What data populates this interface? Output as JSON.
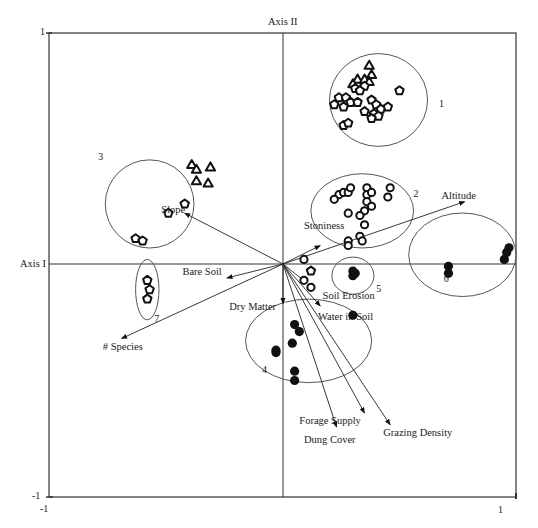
{
  "chart_data": {
    "type": "scatter",
    "subtype": "ordination-biplot",
    "title": "",
    "xlabel": "Axis I",
    "ylabel": "Axis II",
    "xlim": [
      -1,
      1
    ],
    "ylim": [
      -1,
      1
    ],
    "tick_labels": {
      "x_min": "-1",
      "x_max": "1",
      "y_min": "-1",
      "y_max": "1"
    },
    "grid": false,
    "colors": {
      "axis": "#333333",
      "ink": "#111111",
      "circle": "#555555"
    },
    "groups": [
      {
        "id": "1",
        "label": "1",
        "ellipse": {
          "cx": 0.41,
          "cy": 0.71,
          "rx": 0.21,
          "ry": 0.2
        },
        "label_pos": [
          0.67,
          0.69
        ],
        "points": [
          {
            "x": 0.37,
            "y": 0.86,
            "shape": "triangle"
          },
          {
            "x": 0.38,
            "y": 0.82,
            "shape": "triangle"
          },
          {
            "x": 0.32,
            "y": 0.8,
            "shape": "triangle"
          },
          {
            "x": 0.35,
            "y": 0.8,
            "shape": "triangle"
          },
          {
            "x": 0.37,
            "y": 0.79,
            "shape": "triangle"
          },
          {
            "x": 0.3,
            "y": 0.78,
            "shape": "triangle"
          },
          {
            "x": 0.31,
            "y": 0.76,
            "shape": "pentagon"
          },
          {
            "x": 0.35,
            "y": 0.77,
            "shape": "pentagon"
          },
          {
            "x": 0.33,
            "y": 0.75,
            "shape": "pentagon"
          },
          {
            "x": 0.24,
            "y": 0.72,
            "shape": "pentagon"
          },
          {
            "x": 0.27,
            "y": 0.72,
            "shape": "pentagon"
          },
          {
            "x": 0.29,
            "y": 0.7,
            "shape": "pentagon"
          },
          {
            "x": 0.22,
            "y": 0.69,
            "shape": "pentagon"
          },
          {
            "x": 0.26,
            "y": 0.68,
            "shape": "pentagon"
          },
          {
            "x": 0.32,
            "y": 0.7,
            "shape": "pentagon"
          },
          {
            "x": 0.38,
            "y": 0.71,
            "shape": "pentagon"
          },
          {
            "x": 0.4,
            "y": 0.69,
            "shape": "pentagon"
          },
          {
            "x": 0.42,
            "y": 0.67,
            "shape": "pentagon"
          },
          {
            "x": 0.45,
            "y": 0.68,
            "shape": "pentagon"
          },
          {
            "x": 0.5,
            "y": 0.75,
            "shape": "pentagon"
          },
          {
            "x": 0.35,
            "y": 0.66,
            "shape": "pentagon"
          },
          {
            "x": 0.39,
            "y": 0.65,
            "shape": "pentagon"
          },
          {
            "x": 0.41,
            "y": 0.64,
            "shape": "pentagon"
          },
          {
            "x": 0.38,
            "y": 0.63,
            "shape": "pentagon"
          },
          {
            "x": 0.26,
            "y": 0.6,
            "shape": "pentagon"
          },
          {
            "x": 0.28,
            "y": 0.61,
            "shape": "pentagon"
          }
        ]
      },
      {
        "id": "2",
        "label": "2",
        "ellipse": {
          "cx": 0.34,
          "cy": 0.23,
          "rx": 0.22,
          "ry": 0.16
        },
        "label_pos": [
          0.56,
          0.3
        ],
        "points": [
          {
            "x": 0.24,
            "y": 0.3,
            "shape": "ring"
          },
          {
            "x": 0.26,
            "y": 0.31,
            "shape": "ring"
          },
          {
            "x": 0.28,
            "y": 0.31,
            "shape": "ring"
          },
          {
            "x": 0.29,
            "y": 0.33,
            "shape": "ring"
          },
          {
            "x": 0.22,
            "y": 0.28,
            "shape": "ring"
          },
          {
            "x": 0.36,
            "y": 0.33,
            "shape": "ring"
          },
          {
            "x": 0.36,
            "y": 0.3,
            "shape": "ring"
          },
          {
            "x": 0.38,
            "y": 0.31,
            "shape": "ring"
          },
          {
            "x": 0.36,
            "y": 0.27,
            "shape": "ring"
          },
          {
            "x": 0.38,
            "y": 0.25,
            "shape": "ring"
          },
          {
            "x": 0.35,
            "y": 0.23,
            "shape": "ring"
          },
          {
            "x": 0.33,
            "y": 0.21,
            "shape": "ring"
          },
          {
            "x": 0.28,
            "y": 0.22,
            "shape": "ring"
          },
          {
            "x": 0.46,
            "y": 0.33,
            "shape": "ring"
          },
          {
            "x": 0.45,
            "y": 0.29,
            "shape": "ring"
          },
          {
            "x": 0.35,
            "y": 0.17,
            "shape": "ring"
          },
          {
            "x": 0.33,
            "y": 0.12,
            "shape": "ring"
          },
          {
            "x": 0.34,
            "y": 0.1,
            "shape": "ring"
          },
          {
            "x": 0.28,
            "y": 0.1,
            "shape": "ring"
          },
          {
            "x": 0.28,
            "y": 0.08,
            "shape": "ring"
          }
        ]
      },
      {
        "id": "3",
        "label": "3",
        "ellipse": {
          "cx": -0.57,
          "cy": 0.26,
          "rx": 0.19,
          "ry": 0.19
        },
        "label_pos": [
          -0.79,
          0.46
        ],
        "points": [
          {
            "x": -0.39,
            "y": 0.43,
            "shape": "triangle"
          },
          {
            "x": -0.31,
            "y": 0.42,
            "shape": "triangle"
          },
          {
            "x": -0.37,
            "y": 0.41,
            "shape": "triangle"
          },
          {
            "x": -0.37,
            "y": 0.36,
            "shape": "triangle"
          },
          {
            "x": -0.32,
            "y": 0.35,
            "shape": "triangle"
          },
          {
            "x": -0.42,
            "y": 0.26,
            "shape": "pentagon"
          },
          {
            "x": -0.49,
            "y": 0.22,
            "shape": "pentagon"
          },
          {
            "x": -0.63,
            "y": 0.11,
            "shape": "pentagon"
          },
          {
            "x": -0.6,
            "y": 0.1,
            "shape": "pentagon"
          }
        ]
      },
      {
        "id": "4",
        "label": "4",
        "ellipse": {
          "cx": 0.11,
          "cy": -0.33,
          "rx": 0.27,
          "ry": 0.18
        },
        "label_pos": [
          -0.09,
          -0.46
        ],
        "points": [
          {
            "x": 0.05,
            "y": -0.26,
            "shape": "dot"
          },
          {
            "x": 0.07,
            "y": -0.29,
            "shape": "dot"
          },
          {
            "x": 0.04,
            "y": -0.34,
            "shape": "dot"
          },
          {
            "x": -0.03,
            "y": -0.37,
            "shape": "dot"
          },
          {
            "x": -0.03,
            "y": -0.38,
            "shape": "dot"
          },
          {
            "x": 0.05,
            "y": -0.46,
            "shape": "dot"
          },
          {
            "x": 0.05,
            "y": -0.5,
            "shape": "dot"
          },
          {
            "x": 0.3,
            "y": -0.22,
            "shape": "dot"
          }
        ]
      },
      {
        "id": "5",
        "label": "5",
        "ellipse": {
          "cx": 0.3,
          "cy": -0.05,
          "rx": 0.09,
          "ry": 0.08
        },
        "label_pos": [
          0.4,
          -0.11
        ],
        "points": [
          {
            "x": 0.3,
            "y": -0.03,
            "shape": "dot"
          },
          {
            "x": 0.31,
            "y": -0.04,
            "shape": "dot"
          },
          {
            "x": 0.3,
            "y": -0.05,
            "shape": "dot"
          }
        ]
      },
      {
        "id": "6",
        "label": "6",
        "ellipse": {
          "cx": 0.77,
          "cy": 0.04,
          "rx": 0.23,
          "ry": 0.18
        },
        "label_pos": [
          0.69,
          -0.07
        ],
        "points": [
          {
            "x": 0.97,
            "y": 0.07,
            "shape": "dot"
          },
          {
            "x": 0.96,
            "y": 0.05,
            "shape": "dot"
          },
          {
            "x": 0.95,
            "y": 0.02,
            "shape": "dot"
          },
          {
            "x": 0.71,
            "y": -0.01,
            "shape": "dot"
          },
          {
            "x": 0.71,
            "y": -0.04,
            "shape": "dot"
          }
        ]
      },
      {
        "id": "7",
        "label": "7",
        "ellipse": {
          "cx": -0.58,
          "cy": -0.11,
          "rx": 0.05,
          "ry": 0.13
        },
        "label_pos": [
          -0.55,
          -0.24
        ],
        "points": [
          {
            "x": -0.58,
            "y": -0.07,
            "shape": "pentagon"
          },
          {
            "x": -0.57,
            "y": -0.11,
            "shape": "pentagon"
          },
          {
            "x": -0.58,
            "y": -0.15,
            "shape": "pentagon"
          }
        ]
      },
      {
        "id": "center",
        "label": "",
        "ellipse": null,
        "points": [
          {
            "x": 0.09,
            "y": 0.02,
            "shape": "ring"
          },
          {
            "x": 0.12,
            "y": -0.03,
            "shape": "pentagon"
          },
          {
            "x": 0.09,
            "y": -0.07,
            "shape": "ring"
          },
          {
            "x": 0.12,
            "y": -0.1,
            "shape": "ring"
          }
        ]
      }
    ],
    "vectors": [
      {
        "name": "Altitude",
        "end": [
          0.78,
          0.27
        ],
        "label_pos": [
          0.68,
          0.29
        ]
      },
      {
        "name": "Stoniness",
        "end": [
          0.16,
          0.08
        ],
        "label_pos": [
          0.09,
          0.16
        ]
      },
      {
        "name": "Slope",
        "end": [
          -0.42,
          0.22
        ],
        "label_pos": [
          -0.52,
          0.23
        ]
      },
      {
        "name": "Bare Soil",
        "end": [
          -0.24,
          -0.06
        ],
        "label_pos": [
          -0.43,
          -0.04
        ]
      },
      {
        "name": "# Species",
        "end": [
          -0.69,
          -0.32
        ],
        "label_pos": [
          -0.77,
          -0.36
        ]
      },
      {
        "name": "Dry Matter",
        "end": [
          0.0,
          -0.17
        ],
        "label_pos": [
          -0.23,
          -0.19
        ]
      },
      {
        "name": "Soil Erosion",
        "end": [
          0.1,
          -0.08
        ],
        "label_pos": [
          0.17,
          -0.14
        ]
      },
      {
        "name": "Water in Soil",
        "end": [
          0.16,
          -0.18
        ],
        "label_pos": [
          0.15,
          -0.23
        ]
      },
      {
        "name": "Forage Supply",
        "end": [
          0.35,
          -0.64
        ],
        "label_pos": [
          0.07,
          -0.68
        ]
      },
      {
        "name": "Dung Cover",
        "end": [
          0.23,
          -0.7
        ],
        "label_pos": [
          0.09,
          -0.76
        ]
      },
      {
        "name": "Grazing Density",
        "end": [
          0.46,
          -0.69
        ],
        "label_pos": [
          0.43,
          -0.73
        ]
      }
    ]
  }
}
